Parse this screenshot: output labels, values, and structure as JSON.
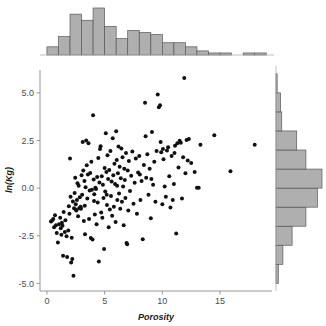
{
  "chart_data": {
    "type": "scatter",
    "title": "",
    "subtitle": "",
    "xlabel": "Porosity",
    "ylabel": "ln(Kg)",
    "xlim": [
      -0.6,
      19.5
    ],
    "ylim": [
      -5.4,
      6.2
    ],
    "xticks": [
      0,
      5,
      10,
      15
    ],
    "xtick_labels": [
      "0",
      "5",
      "10",
      "15"
    ],
    "yticks": [
      5.0,
      2.5,
      0.0,
      -2.5,
      -5.0
    ],
    "ytick_labels": [
      "5.0",
      "2.5",
      "0.0",
      "-2.5",
      "-5.0"
    ],
    "grid": false,
    "legend": false,
    "legend_position": "none",
    "marker": "filled-circle",
    "marker_color": "#111111",
    "marker_size": 2.0,
    "n_points": 196,
    "points": [
      [
        0.35,
        -1.75
      ],
      [
        0.45,
        -1.7
      ],
      [
        0.55,
        -1.62
      ],
      [
        0.62,
        -2.05
      ],
      [
        0.7,
        -1.42
      ],
      [
        0.78,
        -1.95
      ],
      [
        0.85,
        -2.35
      ],
      [
        0.95,
        -2.85
      ],
      [
        1.05,
        -1.9
      ],
      [
        1.15,
        -1.55
      ],
      [
        1.2,
        -2.1
      ],
      [
        1.25,
        -2.45
      ],
      [
        1.35,
        -1.98
      ],
      [
        1.4,
        -3.55
      ],
      [
        1.45,
        -1.25
      ],
      [
        1.55,
        -2.3
      ],
      [
        1.6,
        -1.68
      ],
      [
        1.7,
        -2.52
      ],
      [
        1.75,
        -3.62
      ],
      [
        1.85,
        -2.22
      ],
      [
        1.9,
        -0.95
      ],
      [
        1.95,
        -1.35
      ],
      [
        2.0,
        1.55
      ],
      [
        2.05,
        -0.45
      ],
      [
        2.1,
        -3.9
      ],
      [
        2.15,
        -2.6
      ],
      [
        2.2,
        -3.72
      ],
      [
        2.25,
        -0.7
      ],
      [
        2.3,
        -4.6
      ],
      [
        2.35,
        -1.05
      ],
      [
        2.4,
        -0.25
      ],
      [
        2.45,
        0.55
      ],
      [
        2.5,
        -0.85
      ],
      [
        2.55,
        -1.18
      ],
      [
        2.6,
        -0.62
      ],
      [
        2.65,
        0.25
      ],
      [
        2.7,
        -1.48
      ],
      [
        2.75,
        0.12
      ],
      [
        2.8,
        -1.05
      ],
      [
        2.85,
        -0.48
      ],
      [
        2.9,
        -1.02
      ],
      [
        2.92,
        -0.98
      ],
      [
        2.95,
        -1.08
      ],
      [
        3.0,
        0.68
      ],
      [
        3.05,
        -0.35
      ],
      [
        3.1,
        2.42
      ],
      [
        3.15,
        0.92
      ],
      [
        3.2,
        -1.72
      ],
      [
        3.25,
        0.38
      ],
      [
        3.3,
        -2.42
      ],
      [
        3.35,
        0.05
      ],
      [
        3.4,
        2.5
      ],
      [
        3.45,
        1.2
      ],
      [
        3.5,
        -0.55
      ],
      [
        3.55,
        0.72
      ],
      [
        3.6,
        2.35
      ],
      [
        3.65,
        -1.62
      ],
      [
        3.7,
        -0.12
      ],
      [
        3.75,
        0.8
      ],
      [
        3.8,
        -2.62
      ],
      [
        3.85,
        1.38
      ],
      [
        3.9,
        -0.08
      ],
      [
        3.95,
        -2.7
      ],
      [
        4.0,
        3.82
      ],
      [
        4.05,
        0.45
      ],
      [
        4.1,
        -0.32
      ],
      [
        4.15,
        -1.38
      ],
      [
        4.2,
        0.02
      ],
      [
        4.25,
        -0.05
      ],
      [
        4.3,
        -1.9
      ],
      [
        4.35,
        0.58
      ],
      [
        4.4,
        -0.75
      ],
      [
        4.45,
        1.58
      ],
      [
        4.5,
        -3.85
      ],
      [
        4.55,
        0.3
      ],
      [
        4.6,
        2.05
      ],
      [
        4.65,
        2.2
      ],
      [
        4.7,
        -1.28
      ],
      [
        4.75,
        0.62
      ],
      [
        4.8,
        -1.55
      ],
      [
        4.85,
        0.18
      ],
      [
        4.9,
        -0.52
      ],
      [
        4.95,
        -3.2
      ],
      [
        5.0,
        1.05
      ],
      [
        5.05,
        -0.18
      ],
      [
        5.1,
        2.88
      ],
      [
        5.15,
        0.85
      ],
      [
        5.2,
        -0.88
      ],
      [
        5.25,
        1.72
      ],
      [
        5.3,
        0.48
      ],
      [
        5.35,
        -2.05
      ],
      [
        5.4,
        0.95
      ],
      [
        5.45,
        -1.12
      ],
      [
        5.5,
        1.95
      ],
      [
        5.55,
        -0.42
      ],
      [
        5.6,
        0.35
      ],
      [
        5.65,
        -1.45
      ],
      [
        5.7,
        2.62
      ],
      [
        5.75,
        0.68
      ],
      [
        5.8,
        -0.98
      ],
      [
        5.85,
        1.28
      ],
      [
        5.9,
        0.22
      ],
      [
        5.95,
        -1.78
      ],
      [
        6.0,
        2.98
      ],
      [
        6.05,
        1.48
      ],
      [
        6.1,
        -0.62
      ],
      [
        6.15,
        0.78
      ],
      [
        6.2,
        2.18
      ],
      [
        6.25,
        -0.28
      ],
      [
        6.3,
        1.12
      ],
      [
        6.35,
        -1.08
      ],
      [
        6.4,
        0.52
      ],
      [
        6.45,
        2.08
      ],
      [
        6.5,
        -0.72
      ],
      [
        6.55,
        1.62
      ],
      [
        6.6,
        0.08
      ],
      [
        6.65,
        -1.95
      ],
      [
        6.7,
        1.02
      ],
      [
        6.75,
        0.42
      ],
      [
        6.8,
        -0.52
      ],
      [
        6.85,
        1.85
      ],
      [
        6.9,
        -2.88
      ],
      [
        6.95,
        -2.95
      ],
      [
        7.0,
        0.92
      ],
      [
        7.1,
        1.42
      ],
      [
        7.2,
        -0.15
      ],
      [
        7.3,
        0.65
      ],
      [
        7.4,
        1.92
      ],
      [
        7.5,
        -0.82
      ],
      [
        7.6,
        0.28
      ],
      [
        7.7,
        1.55
      ],
      [
        7.8,
        -1.35
      ],
      [
        7.9,
        0.82
      ],
      [
        8.0,
        1.68
      ],
      [
        8.1,
        -0.62
      ],
      [
        8.2,
        0.38
      ],
      [
        8.3,
        -2.68
      ],
      [
        8.4,
        1.22
      ],
      [
        8.5,
        4.48
      ],
      [
        8.55,
        2.72
      ],
      [
        8.6,
        0.55
      ],
      [
        8.7,
        1.78
      ],
      [
        8.8,
        -0.35
      ],
      [
        8.9,
        1.02
      ],
      [
        9.0,
        -1.58
      ],
      [
        9.1,
        2.95
      ],
      [
        9.2,
        0.18
      ],
      [
        9.3,
        1.38
      ],
      [
        9.4,
        -0.72
      ],
      [
        9.5,
        1.95
      ],
      [
        9.6,
        4.92
      ],
      [
        9.7,
        4.25
      ],
      [
        9.8,
        4.35
      ],
      [
        9.85,
        2.42
      ],
      [
        9.9,
        1.88
      ],
      [
        10.0,
        -0.85
      ],
      [
        10.1,
        1.52
      ],
      [
        10.2,
        0.08
      ],
      [
        10.3,
        -0.45
      ],
      [
        10.4,
        1.98
      ],
      [
        10.5,
        2.15
      ],
      [
        10.6,
        0.62
      ],
      [
        10.7,
        -1.02
      ],
      [
        10.8,
        1.68
      ],
      [
        10.9,
        -0.62
      ],
      [
        11.0,
        0.22
      ],
      [
        11.1,
        2.22
      ],
      [
        11.2,
        -2.38
      ],
      [
        11.3,
        2.35
      ],
      [
        11.4,
        1.08
      ],
      [
        11.5,
        2.48
      ],
      [
        11.6,
        2.38
      ],
      [
        11.7,
        -0.55
      ],
      [
        11.8,
        1.62
      ],
      [
        11.9,
        5.78
      ],
      [
        12.0,
        0.78
      ],
      [
        12.1,
        2.52
      ],
      [
        12.2,
        1.45
      ],
      [
        12.3,
        2.58
      ],
      [
        12.5,
        1.32
      ],
      [
        12.8,
        0.85
      ],
      [
        13.0,
        0.02
      ],
      [
        13.15,
        0.02
      ],
      [
        13.3,
        2.28
      ],
      [
        14.5,
        2.78
      ],
      [
        15.9,
        0.88
      ],
      [
        18.0,
        2.28
      ],
      [
        1.3,
        -1.82
      ],
      [
        2.48,
        -1.12
      ],
      [
        3.28,
        -0.92
      ],
      [
        4.08,
        -0.68
      ],
      [
        5.18,
        -0.35
      ],
      [
        6.08,
        0.12
      ],
      [
        7.05,
        -1.18
      ],
      [
        8.05,
        0.72
      ],
      [
        9.05,
        0.48
      ],
      [
        10.05,
        2.05
      ],
      [
        11.05,
        1.85
      ]
    ],
    "marginal_top": {
      "type": "bar",
      "orientation": "vertical",
      "title": "",
      "bin_width": 1.0,
      "bin_starts": [
        0,
        1,
        2,
        3,
        4,
        5,
        6,
        7,
        8,
        9,
        10,
        11,
        12,
        13,
        14,
        15,
        16,
        17,
        18
      ],
      "bin_labels": [
        "0-1",
        "1-2",
        "2-3",
        "3-4",
        "4-5",
        "5-6",
        "6-7",
        "7-8",
        "8-9",
        "9-10",
        "10-11",
        "11-12",
        "12-13",
        "13-14",
        "14-15",
        "15-16",
        "16-17",
        "17-18",
        "18-19"
      ],
      "counts": [
        4,
        9,
        20,
        17,
        23,
        14,
        8,
        12,
        11,
        10,
        6,
        6,
        4,
        2,
        1,
        1,
        0,
        1,
        1
      ],
      "max_count": 23
    },
    "marginal_right": {
      "type": "bar",
      "orientation": "horizontal",
      "title": "",
      "bin_width": 1.0,
      "bin_starts": [
        -5,
        -4,
        -3,
        -2,
        -1,
        0,
        1,
        2,
        3,
        4,
        5
      ],
      "bin_labels": [
        "-5 to -4",
        "-4 to -3",
        "-3 to -2",
        "-2 to -1",
        "-1 to 0",
        "0 to 1",
        "1 to 2",
        "2 to 3",
        "3 to 4",
        "4 to 5",
        "5 to 6"
      ],
      "counts": [
        2,
        6,
        14,
        26,
        36,
        40,
        26,
        18,
        5,
        4,
        1
      ],
      "max_count": 40
    },
    "colors": {
      "bar_fill": "#a8a8a8",
      "bar_stroke": "#595959",
      "point": "#111111",
      "axis": "#8c8c8c",
      "tick_text": "#4d4d4d",
      "axis_title": "#1a1a1a",
      "background": "#ffffff"
    }
  }
}
